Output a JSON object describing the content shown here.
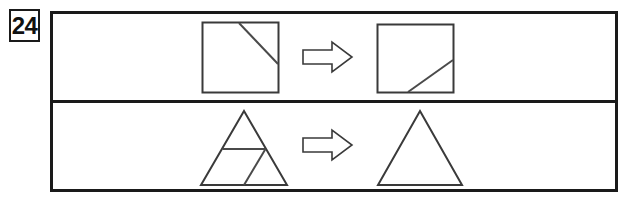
{
  "page": {
    "width": 627,
    "height": 203,
    "background_color": "#ffffff",
    "ink_color": "#1a1a1a",
    "shape_stroke_color": "#3a3a3a"
  },
  "question": {
    "number": "24",
    "number_box_label": "question-number"
  },
  "frame": {
    "border_color": "#1a1a1a",
    "divider_color": "#1a1a1a"
  },
  "rows": [
    {
      "id": "row-top",
      "name": "square-transformation-row",
      "left_figure": {
        "shape": "square",
        "label": "square-with-diagonal-top-right",
        "description": "Square with a diagonal line from the top edge down to the right edge, cutting off the upper-right corner"
      },
      "operator": {
        "icon": "right-arrow-icon",
        "glyph": "⇨",
        "label": "transforms-to"
      },
      "right_figure": {
        "shape": "square",
        "label": "square-with-diagonal-bottom-right",
        "description": "Square with a diagonal line from the bottom edge up to the right edge, cutting off the lower-right corner"
      }
    },
    {
      "id": "row-bottom",
      "name": "triangle-transformation-row",
      "left_figure": {
        "shape": "triangle",
        "label": "triangle-subdivided",
        "description": "Triangle divided by a horizontal line and a slanted line into smaller regions"
      },
      "operator": {
        "icon": "right-arrow-icon",
        "glyph": "⇨",
        "label": "transforms-to"
      },
      "right_figure": {
        "shape": "triangle",
        "label": "triangle-plain",
        "description": "Plain undivided triangle"
      }
    }
  ]
}
